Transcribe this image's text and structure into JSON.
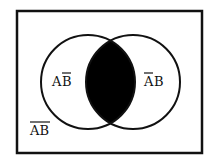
{
  "diagram": {
    "type": "venn",
    "universe_border_color": "#111111",
    "shaded_color": "#000000",
    "circles": [
      {
        "name": "A",
        "cx": 88,
        "cy": 82,
        "r": 47
      },
      {
        "name": "B",
        "cx": 133,
        "cy": 82,
        "r": 47
      }
    ],
    "shaded_region": "A∩B",
    "labels": {
      "left_only": {
        "first": "A",
        "second": "B",
        "bar_on": "second",
        "meaning": "A and not B"
      },
      "right_only": {
        "first": "A",
        "second": "B",
        "bar_on": "first",
        "meaning": "not A and B"
      },
      "outside": {
        "text": "AB",
        "bar_on": "both",
        "meaning": "not (A or B)"
      }
    }
  }
}
